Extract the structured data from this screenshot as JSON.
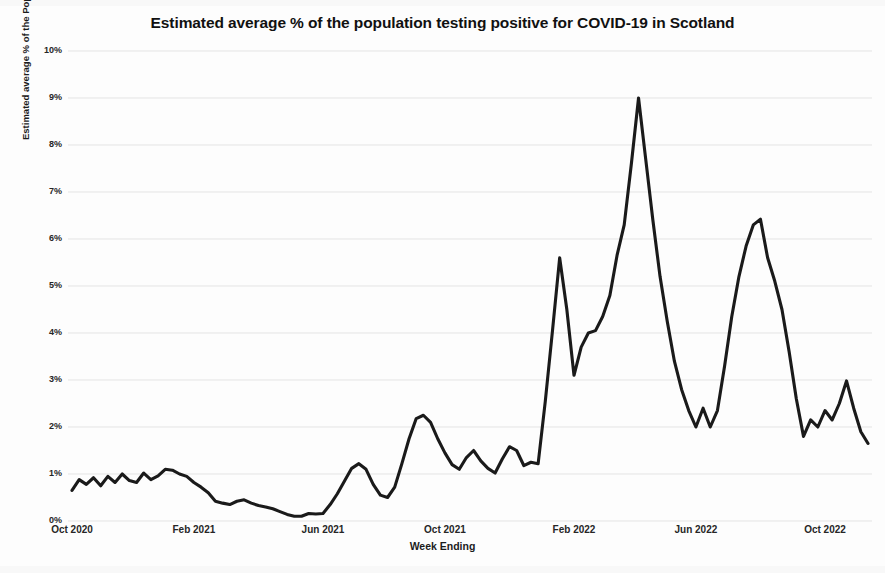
{
  "chart_data": {
    "type": "line",
    "title": "Estimated average % of the population testing positive for COVID-19 in Scotland",
    "xlabel": "Week Ending",
    "ylabel": "Estimated average % of the Population testing positive for Covid-19",
    "ylim": [
      0,
      10
    ],
    "y_tick_labels": [
      "0%",
      "1%",
      "2%",
      "3%",
      "4%",
      "5%",
      "6%",
      "7%",
      "8%",
      "9%",
      "10%"
    ],
    "y_tick_values": [
      0,
      1,
      2,
      3,
      4,
      5,
      6,
      7,
      8,
      9,
      10
    ],
    "x_tick_labels": [
      "Oct 2020",
      "Feb 2021",
      "Jun 2021",
      "Oct 2021",
      "Feb 2022",
      "Jun 2022",
      "Oct 2022"
    ],
    "x_tick_positions": [
      0,
      17,
      35,
      52,
      70,
      87,
      105
    ],
    "grid": "horizontal",
    "legend": "none",
    "series_name": "Estimated average % testing positive",
    "line_color": "#1a1a1a",
    "x_index_range": [
      0,
      107
    ],
    "values": [
      0.65,
      0.88,
      0.78,
      0.92,
      0.75,
      0.95,
      0.82,
      1.0,
      0.86,
      0.82,
      1.02,
      0.88,
      0.96,
      1.1,
      1.08,
      1.0,
      0.95,
      0.82,
      0.72,
      0.6,
      0.42,
      0.38,
      0.35,
      0.42,
      0.45,
      0.38,
      0.33,
      0.3,
      0.26,
      0.2,
      0.14,
      0.1,
      0.1,
      0.16,
      0.15,
      0.16,
      0.35,
      0.58,
      0.85,
      1.12,
      1.22,
      1.1,
      0.78,
      0.55,
      0.5,
      0.72,
      1.22,
      1.75,
      2.18,
      2.25,
      2.1,
      1.75,
      1.45,
      1.2,
      1.1,
      1.35,
      1.5,
      1.28,
      1.12,
      1.02,
      1.32,
      1.58,
      1.5,
      1.18,
      1.25,
      1.22,
      2.55,
      4.05,
      5.6,
      4.5,
      3.1,
      3.7,
      4.0,
      4.05,
      4.35,
      4.8,
      5.65,
      6.3,
      7.6,
      9.0,
      7.7,
      6.4,
      5.2,
      4.25,
      3.4,
      2.8,
      2.35,
      2.0,
      2.4,
      2.0,
      2.35,
      3.3,
      4.35,
      5.2,
      5.85,
      6.3,
      6.42,
      5.6,
      5.1,
      4.5,
      3.6,
      2.6,
      1.8,
      2.15,
      2.0,
      2.35,
      2.15,
      2.5,
      2.98,
      2.4,
      1.9,
      1.65
    ]
  },
  "axis": {
    "plot_left_px": 68,
    "plot_right_px": 872,
    "plot_top_px": 51,
    "plot_bottom_px": 521
  }
}
